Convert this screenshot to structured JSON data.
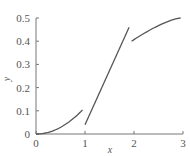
{
  "chart_data": {
    "type": "line",
    "title": "",
    "xlabel": "x",
    "ylabel": "y",
    "xlim": [
      0,
      3
    ],
    "ylim": [
      0,
      0.5
    ],
    "grid": false,
    "x_ticks": [
      "0",
      "1",
      "2",
      "3"
    ],
    "y_ticks": [
      "0",
      "0.1",
      "0.2",
      "0.3",
      "0.4",
      "0.5"
    ],
    "series": [
      {
        "name": "segment-1",
        "x": [
          0,
          0.25,
          0.5,
          0.75,
          0.95
        ],
        "y": [
          0,
          0.006,
          0.025,
          0.06,
          0.105
        ]
      },
      {
        "name": "segment-2",
        "x": [
          1.0,
          1.9
        ],
        "y": [
          0.04,
          0.46
        ]
      },
      {
        "name": "segment-3",
        "x": [
          1.95,
          2.5,
          2.95
        ],
        "y": [
          0.4,
          0.46,
          0.5
        ]
      }
    ],
    "colors": {
      "line": "#555555",
      "axis": "#777777"
    }
  }
}
